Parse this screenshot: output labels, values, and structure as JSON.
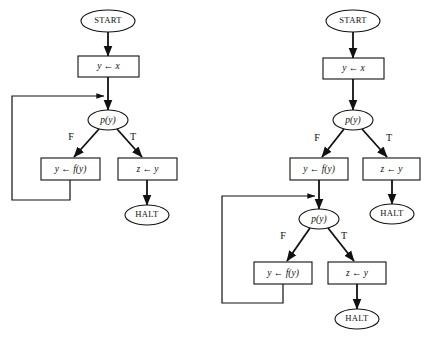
{
  "figure": {
    "type": "flowchart-pair",
    "background_color": "#ffffff",
    "line_color": "#111111"
  },
  "labels": {
    "start": "START",
    "halt": "HALT",
    "assign_y_x": "y ← x",
    "predicate": "p(y)",
    "assign_y_fy": "y ← f(y)",
    "assign_z_y": "z ← y",
    "branch_false": "F",
    "branch_true": "T"
  },
  "diagrams": [
    {
      "id": "left-flowchart",
      "name": "loop-flowchart",
      "nodes": [
        {
          "id": "l-start",
          "kind": "terminal",
          "label": "START",
          "cx": 108,
          "cy": 21,
          "rx": 27,
          "ry": 11
        },
        {
          "id": "l-assign1",
          "kind": "process",
          "label": "y ← x",
          "x": 78,
          "y": 56,
          "w": 61,
          "h": 21
        },
        {
          "id": "l-pred",
          "kind": "decision",
          "label": "p(y)",
          "cx": 108,
          "cy": 120,
          "rx": 20,
          "ry": 10
        },
        {
          "id": "l-assign2",
          "kind": "process",
          "label": "y ← f(y)",
          "x": 41,
          "y": 158,
          "w": 59,
          "h": 22
        },
        {
          "id": "l-assign3",
          "kind": "process",
          "label": "z ← y",
          "x": 118,
          "y": 158,
          "w": 59,
          "h": 22
        },
        {
          "id": "l-halt",
          "kind": "terminal",
          "label": "HALT",
          "cx": 147,
          "cy": 215,
          "rx": 22,
          "ry": 10
        }
      ],
      "branch_labels": [
        {
          "id": "l-f",
          "text": "F",
          "x": 71,
          "y": 138
        },
        {
          "id": "l-t",
          "text": "T",
          "x": 133,
          "y": 138
        }
      ],
      "edges": [
        {
          "id": "l-e1",
          "from": "l-start",
          "to": "l-assign1",
          "points": "108,32 108,56",
          "arrow": true
        },
        {
          "id": "l-e2",
          "from": "l-assign1",
          "to": "l-pred",
          "points": "108,77 108,110",
          "arrow": true
        },
        {
          "id": "l-e3",
          "from": "l-pred",
          "to": "l-assign2",
          "points": "99,129 74,157",
          "arrow": true,
          "branch": "F"
        },
        {
          "id": "l-e4",
          "from": "l-pred",
          "to": "l-assign3",
          "points": "117,129 142,157",
          "arrow": true,
          "branch": "T"
        },
        {
          "id": "l-e5",
          "from": "l-assign3",
          "to": "l-halt",
          "points": "147,180 147,205",
          "arrow": true
        },
        {
          "id": "l-e6",
          "from": "l-assign2",
          "to": "l-pred",
          "points": "70,180 70,200 12,200 12,96 104,96",
          "arrow": true,
          "kind": "loop-back"
        }
      ]
    },
    {
      "id": "right-flowchart",
      "name": "unrolled-loop-flowchart",
      "nodes": [
        {
          "id": "r-start",
          "kind": "terminal",
          "label": "START",
          "cx": 353,
          "cy": 21,
          "rx": 27,
          "ry": 11
        },
        {
          "id": "r-assign1",
          "kind": "process",
          "label": "y ← x",
          "x": 323,
          "y": 58,
          "w": 61,
          "h": 21
        },
        {
          "id": "r-pred1",
          "kind": "decision",
          "label": "p(y)",
          "cx": 353,
          "cy": 120,
          "rx": 20,
          "ry": 10
        },
        {
          "id": "r-assign2",
          "kind": "process",
          "label": "y ← f(y)",
          "x": 290,
          "y": 158,
          "w": 58,
          "h": 22
        },
        {
          "id": "r-assign3",
          "kind": "process",
          "label": "z ← y",
          "x": 363,
          "y": 158,
          "w": 57,
          "h": 22
        },
        {
          "id": "r-halt1",
          "kind": "terminal",
          "label": "HALT",
          "cx": 392,
          "cy": 214,
          "rx": 22,
          "ry": 10
        },
        {
          "id": "r-pred2",
          "kind": "decision",
          "label": "p(y)",
          "cx": 319,
          "cy": 219,
          "rx": 20,
          "ry": 10
        },
        {
          "id": "r-assign4",
          "kind": "process",
          "label": "y ← f(y)",
          "x": 254,
          "y": 262,
          "w": 58,
          "h": 22
        },
        {
          "id": "r-assign5",
          "kind": "process",
          "label": "z ← y",
          "x": 328,
          "y": 262,
          "w": 58,
          "h": 22
        },
        {
          "id": "r-halt2",
          "kind": "terminal",
          "label": "HALT",
          "cx": 357,
          "cy": 319,
          "rx": 22,
          "ry": 10
        }
      ],
      "branch_labels": [
        {
          "id": "r-f1",
          "text": "F",
          "x": 317,
          "y": 139
        },
        {
          "id": "r-t1",
          "text": "T",
          "x": 389,
          "y": 139
        },
        {
          "id": "r-f2",
          "text": "F",
          "x": 283,
          "y": 237
        },
        {
          "id": "r-t2",
          "text": "T",
          "x": 344,
          "y": 237
        }
      ],
      "edges": [
        {
          "id": "r-e1",
          "from": "r-start",
          "to": "r-assign1",
          "points": "353,32 353,58",
          "arrow": true
        },
        {
          "id": "r-e2",
          "from": "r-assign1",
          "to": "r-pred1",
          "points": "353,79 353,110",
          "arrow": true
        },
        {
          "id": "r-e3",
          "from": "r-pred1",
          "to": "r-assign2",
          "points": "344,129 322,157",
          "arrow": true,
          "branch": "F"
        },
        {
          "id": "r-e4",
          "from": "r-pred1",
          "to": "r-assign3",
          "points": "362,129 387,157",
          "arrow": true,
          "branch": "T"
        },
        {
          "id": "r-e5",
          "from": "r-assign3",
          "to": "r-halt1",
          "points": "392,180 392,204",
          "arrow": true
        },
        {
          "id": "r-e6",
          "from": "r-assign2",
          "to": "r-pred2",
          "points": "319,180 319,209",
          "arrow": true
        },
        {
          "id": "r-e7",
          "from": "r-pred2",
          "to": "r-assign4",
          "points": "310,228 287,261",
          "arrow": true,
          "branch": "F"
        },
        {
          "id": "r-e8",
          "from": "r-pred2",
          "to": "r-assign5",
          "points": "328,228 354,261",
          "arrow": true,
          "branch": "T"
        },
        {
          "id": "r-e9",
          "from": "r-assign5",
          "to": "r-halt2",
          "points": "357,284 357,309",
          "arrow": true
        },
        {
          "id": "r-e10",
          "from": "r-assign4",
          "to": "r-pred2",
          "points": "283,284 283,303 222,303 222,196 315,196",
          "arrow": true,
          "kind": "loop-back"
        }
      ]
    }
  ]
}
